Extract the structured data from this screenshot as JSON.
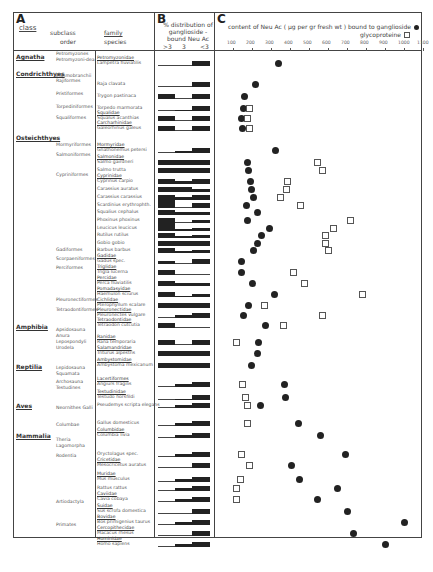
{
  "panels": {
    "a": {
      "letter": "A",
      "col_class": "class",
      "col_subclass": "subclass",
      "col_order": "order",
      "col_family": "family",
      "col_species": "species"
    },
    "b": {
      "letter": "B",
      "title": "% distribution of ganglioside - bound Neu Ac",
      "ticks": [
        ">3",
        "3",
        "<3"
      ]
    },
    "c": {
      "letter": "C",
      "title": "content of Neu Ac ( µg per gr fresh wt ) bound to ganglioside",
      "legend_ganglioside": "ganglioside",
      "legend_glycoprotein": "glycoproteine",
      "ticks": [
        "100",
        "200",
        "300",
        "400",
        "500",
        "600",
        "700",
        "800",
        "900",
        "1000",
        "1100"
      ]
    }
  },
  "classes": [
    {
      "label": "Agnatha",
      "y": 56
    },
    {
      "label": "Condrichthyes",
      "y": 73
    },
    {
      "label": "Osteichthyes",
      "y": 137
    },
    {
      "label": "Amphibia",
      "y": 326
    },
    {
      "label": "Reptilia",
      "y": 366
    },
    {
      "label": "Aves",
      "y": 405
    },
    {
      "label": "Mammalia",
      "y": 435
    }
  ],
  "orders": [
    {
      "label": "Petromyzones",
      "y": 54
    },
    {
      "label": "Petromyzoni-dea",
      "y": 60
    },
    {
      "label": "Elasmobranchii",
      "y": 76
    },
    {
      "label": "Rajiformes",
      "y": 81
    },
    {
      "label": "Pristiformes",
      "y": 94
    },
    {
      "label": "Torpediniformes",
      "y": 107
    },
    {
      "label": "Squaliformes",
      "y": 118
    },
    {
      "label": "Mormyriformes",
      "y": 145
    },
    {
      "label": "Salmoniformes",
      "y": 155
    },
    {
      "label": "Cypriniformes",
      "y": 175
    },
    {
      "label": "Gadiformes",
      "y": 250
    },
    {
      "label": "Scorpaeniformes",
      "y": 259
    },
    {
      "label": "Perciformes",
      "y": 268
    },
    {
      "label": "Pleuronectiformes",
      "y": 300
    },
    {
      "label": "Tetraodontiformes",
      "y": 310
    },
    {
      "label": "Apsidosauna Anura",
      "y": 330
    },
    {
      "label": "Lepospondyli Urodela",
      "y": 342
    },
    {
      "label": "Lepidosauna Squamata",
      "y": 368
    },
    {
      "label": "Archosauna Testudines",
      "y": 382
    },
    {
      "label": "Neornithes Galli",
      "y": 408
    },
    {
      "label": "Columbae",
      "y": 425
    },
    {
      "label": "Theria Lagomorpha",
      "y": 440
    },
    {
      "label": "Rodentia",
      "y": 456
    },
    {
      "label": "Artiodactyla",
      "y": 502
    },
    {
      "label": "Primates",
      "y": 525
    }
  ],
  "species": [
    {
      "family": "Petromyzonidae",
      "name": "Lampetra fluviatilis",
      "y": 63,
      "b": [
        0,
        0,
        1
      ],
      "gang": 340,
      "glyco": null
    },
    {
      "family": "",
      "name": "Raja clavata",
      "y": 84,
      "b": [
        0,
        0,
        1
      ],
      "gang": 220,
      "glyco": null
    },
    {
      "family": "",
      "name": "Trygon pastinaca",
      "y": 96,
      "b": [
        1,
        0,
        1
      ],
      "gang": 160,
      "glyco": null
    },
    {
      "family": "",
      "name": "Torpedo marmorata",
      "y": 108,
      "b": [
        0,
        0.2,
        1
      ],
      "gang": 155,
      "glyco": 185
    },
    {
      "family": "Squalidae",
      "name": "Squalus acanthias",
      "y": 118,
      "b": [
        1,
        0,
        1
      ],
      "gang": 145,
      "glyco": 175
    },
    {
      "family": "Carcharhinidae",
      "name": "Galeorhinus galeus",
      "y": 128,
      "b": [
        1,
        0,
        1
      ],
      "gang": 150,
      "glyco": 185
    },
    {
      "family": "Mormyridae",
      "name": "Gnathonemus petersi",
      "y": 150,
      "b": [
        0,
        0.4,
        1
      ],
      "gang": 325,
      "glyco": null
    },
    {
      "family": "Salmonidae",
      "name": "Salmo gairdneri",
      "y": 162,
      "b": [
        1,
        1,
        1
      ],
      "gang": 175,
      "glyco": 545
    },
    {
      "family": "",
      "name": "Salmo trutta",
      "y": 170,
      "b": [
        1,
        1,
        1
      ],
      "gang": 180,
      "glyco": 570
    },
    {
      "family": "Cyprinidae",
      "name": "Cyprinus carpio",
      "y": 181,
      "b": [
        1,
        0.5,
        1
      ],
      "gang": 190,
      "glyco": 385
    },
    {
      "family": "",
      "name": "Carassius auratus",
      "y": 189,
      "b": [
        1,
        1,
        0.5
      ],
      "gang": 195,
      "glyco": 380
    },
    {
      "family": "",
      "name": "Carassius carassius",
      "y": 197,
      "b": [
        1,
        0.5,
        1
      ],
      "gang": 210,
      "glyco": 350
    },
    {
      "family": "",
      "name": "Scardinius erythrophth.",
      "y": 205,
      "b": [
        1.6,
        0,
        1
      ],
      "gang": 170,
      "glyco": 455
    },
    {
      "family": "",
      "name": "Squalius cephalus",
      "y": 212,
      "b": [
        1,
        0.5,
        0.5
      ],
      "gang": 230,
      "glyco": null
    },
    {
      "family": "",
      "name": "Phoxinus phoxinus",
      "y": 220,
      "b": [
        1,
        0,
        0.5
      ],
      "gang": 175,
      "glyco": 720
    },
    {
      "family": "",
      "name": "Leucicus leucicus",
      "y": 228,
      "b": [
        1.6,
        0.3,
        0.5
      ],
      "gang": 290,
      "glyco": 630
    },
    {
      "family": "",
      "name": "Rutilus rutilus",
      "y": 235,
      "b": [
        1,
        0.3,
        0.5
      ],
      "gang": 250,
      "glyco": 585
    },
    {
      "family": "",
      "name": "Gobio gobio",
      "y": 243,
      "b": [
        1,
        1,
        1
      ],
      "gang": 230,
      "glyco": 585
    },
    {
      "family": "",
      "name": "Barbus barbus",
      "y": 250,
      "b": [
        1,
        0.3,
        0.5
      ],
      "gang": 210,
      "glyco": 600
    },
    {
      "family": "Gadidae",
      "name": "Gadus spec.",
      "y": 261,
      "b": [
        0.5,
        0,
        1
      ],
      "gang": 145,
      "glyco": null
    },
    {
      "family": "Triglidae",
      "name": "Trigla lucerna",
      "y": 272,
      "b": [
        1,
        0,
        0
      ],
      "gang": 145,
      "glyco": 420
    },
    {
      "family": "Percidae",
      "name": "Perca fluviatilis",
      "y": 283,
      "b": [
        1,
        0.5,
        0.5
      ],
      "gang": 200,
      "glyco": 475
    },
    {
      "family": "Pomadasyidae",
      "name": "Haemulon sciurus",
      "y": 294,
      "b": [
        1,
        0.2,
        0.5
      ],
      "gang": 320,
      "glyco": 780
    },
    {
      "family": "Cichlidae",
      "name": "Pterophyllum scalare",
      "y": 305,
      "b": [
        1,
        1,
        1
      ],
      "gang": 180,
      "glyco": 265
    },
    {
      "family": "Pleuronectidae",
      "name": "Pleuronectes vulgare",
      "y": 315,
      "b": [
        0,
        0.5,
        1
      ],
      "gang": 155,
      "glyco": 570
    },
    {
      "family": "Tetraodontidae",
      "name": "Tetraodon cutcutia",
      "y": 325,
      "b": [
        1,
        0,
        0
      ],
      "gang": 270,
      "glyco": 365
    },
    {
      "family": "Ranidae",
      "name": "Rana temporaria",
      "y": 342,
      "b": [
        1,
        0,
        1
      ],
      "gang": 235,
      "glyco": 120
    },
    {
      "family": "Salamandridae",
      "name": "Triturus alpestris",
      "y": 353,
      "b": [
        1,
        1,
        1
      ],
      "gang": 230,
      "glyco": null
    },
    {
      "family": "Ambystomidae",
      "name": "Ambystoma mexicanum",
      "y": 365,
      "b": [
        1,
        1,
        1
      ],
      "gang": 195,
      "glyco": null
    },
    {
      "family": "Lacertiformes",
      "name": "Angiurs fragilis",
      "y": 384,
      "b": [
        0,
        0.5,
        1
      ],
      "gang": 370,
      "glyco": 150
    },
    {
      "family": "Testudinidae",
      "name": "Testudo horsfildi",
      "y": 397,
      "b": [
        0,
        0.2,
        1
      ],
      "gang": 375,
      "glyco": 165
    },
    {
      "family": "",
      "name": "Pseudemys scripta elegans",
      "y": 405,
      "b": [
        0,
        0.5,
        1
      ],
      "gang": 245,
      "glyco": 175
    },
    {
      "family": "",
      "name": "Gallus domesticus",
      "y": 423,
      "b": [
        0,
        0.5,
        1
      ],
      "gang": 445,
      "glyco": 175
    },
    {
      "family": "Columbidae",
      "name": "Columbia livia",
      "y": 435,
      "b": [
        0,
        0.5,
        1
      ],
      "gang": 560,
      "glyco": null
    },
    {
      "family": "",
      "name": "Oryctolagus spec.",
      "y": 454,
      "b": [
        0,
        0.5,
        1
      ],
      "gang": 690,
      "glyco": 145
    },
    {
      "family": "Cricetidae",
      "name": "Mesocricetus auratus",
      "y": 465,
      "b": [
        0,
        0,
        1
      ],
      "gang": 410,
      "glyco": 185
    },
    {
      "family": "Muridae",
      "name": "Mus musculus",
      "y": 479,
      "b": [
        0,
        0.5,
        1
      ],
      "gang": 450,
      "glyco": 140
    },
    {
      "family": "",
      "name": "Rattus rattus",
      "y": 488,
      "b": [
        0,
        0.5,
        1
      ],
      "gang": 650,
      "glyco": 120
    },
    {
      "family": "Caviidae",
      "name": "Cavia cobaya",
      "y": 499,
      "b": [
        0,
        0.5,
        1
      ],
      "gang": 545,
      "glyco": 120
    },
    {
      "family": "Suidae",
      "name": "Sus scrofa domestica",
      "y": 511,
      "b": [
        0,
        0,
        1
      ],
      "gang": 700,
      "glyco": null
    },
    {
      "family": "Bovidae",
      "name": "Bos primigenius taurus",
      "y": 522,
      "b": [
        0,
        0.5,
        1
      ],
      "gang": 1000,
      "glyco": null
    },
    {
      "family": "Cercopithecidae",
      "name": "Macacus rhesus",
      "y": 533,
      "b": [
        0,
        0,
        1
      ],
      "gang": 735,
      "glyco": null
    },
    {
      "family": "Hominidae",
      "name": "Homo sapiens",
      "y": 544,
      "b": [
        0,
        0.5,
        1
      ],
      "gang": 900,
      "glyco": null
    }
  ],
  "chart_data": {
    "type": "scatter",
    "xlabel": "Neu Ac µg per gr fresh wt",
    "ylabel": "species",
    "xlim": [
      0,
      1150
    ],
    "x_ticks": [
      100,
      200,
      300,
      400,
      500,
      600,
      700,
      800,
      900,
      1000,
      1100
    ],
    "legend": [
      "ganglioside (filled circle)",
      "glycoproteine (open square)"
    ],
    "categories": [
      "Lampetra fluviatilis",
      "Raja clavata",
      "Trygon pastinaca",
      "Torpedo marmorata",
      "Squalus acanthias",
      "Galeorhinus galeus",
      "Gnathonemus petersi",
      "Salmo gairdneri",
      "Salmo trutta",
      "Cyprinus carpio",
      "Carassius auratus",
      "Carassius carassius",
      "Scardinius erythrophth.",
      "Squalius cephalus",
      "Phoxinus phoxinus",
      "Leucicus leucicus",
      "Rutilus rutilus",
      "Gobio gobio",
      "Barbus barbus",
      "Gadus spec.",
      "Trigla lucerna",
      "Perca fluviatilis",
      "Haemulon sciurus",
      "Pterophyllum scalare",
      "Pleuronectes vulgare",
      "Tetraodon cutcutia",
      "Rana temporaria",
      "Triturus alpestris",
      "Ambystoma mexicanum",
      "Angiurs fragilis",
      "Testudo horsfildi",
      "Pseudemys scripta elegans",
      "Gallus domesticus",
      "Columbia livia",
      "Oryctolagus spec.",
      "Mesocricetus auratus",
      "Mus musculus",
      "Rattus rattus",
      "Cavia cobaya",
      "Sus scrofa domestica",
      "Bos primigenius taurus",
      "Macacus rhesus",
      "Homo sapiens"
    ],
    "series": [
      {
        "name": "ganglioside",
        "marker": "filled circle",
        "values": [
          340,
          220,
          160,
          155,
          145,
          150,
          325,
          175,
          180,
          190,
          195,
          210,
          170,
          230,
          175,
          290,
          250,
          230,
          210,
          145,
          145,
          200,
          320,
          180,
          155,
          270,
          235,
          230,
          195,
          370,
          375,
          245,
          445,
          560,
          690,
          410,
          450,
          650,
          545,
          700,
          1000,
          735,
          900
        ]
      },
      {
        "name": "glycoproteine",
        "marker": "open square",
        "values": [
          null,
          null,
          null,
          185,
          175,
          185,
          null,
          545,
          570,
          385,
          380,
          350,
          455,
          null,
          720,
          630,
          585,
          585,
          600,
          null,
          420,
          475,
          780,
          265,
          570,
          365,
          120,
          null,
          null,
          150,
          165,
          175,
          175,
          null,
          145,
          185,
          140,
          120,
          120,
          null,
          null,
          null,
          null
        ]
      }
    ]
  }
}
